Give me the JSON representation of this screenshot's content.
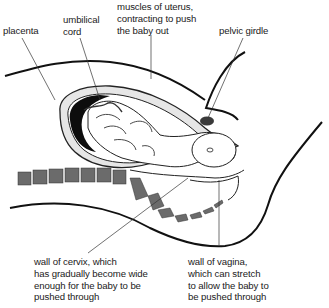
{
  "diagram": {
    "type": "anatomical cross-section",
    "colors": {
      "outline": "#111111",
      "placenta": "#0d0d0d",
      "uterus_wall": "#e4e4e4",
      "spine": "#6b6b6b",
      "pelvic_girdle": "#3a3a3a",
      "leader_line": "#333333"
    },
    "labels": {
      "placenta": [
        "placenta"
      ],
      "umbilical_cord": [
        "umbilical",
        "cord"
      ],
      "muscles_of_uterus": [
        "muscles of uterus,",
        "contracting to push",
        "the baby out"
      ],
      "pelvic_girdle": [
        "pelvic girdle"
      ],
      "wall_of_cervix": [
        "wall of cervix, which",
        "has gradually become wide",
        "enough for the baby to be",
        "pushed through"
      ],
      "wall_of_vagina": [
        "wall of vagina,",
        "which can stretch",
        "to allow the baby to",
        "be pushed through"
      ]
    }
  }
}
